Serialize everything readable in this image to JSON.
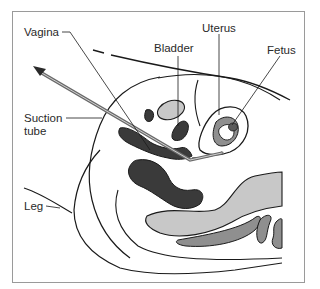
{
  "diagram": {
    "type": "anatomical-illustration",
    "labels": {
      "vagina": "Vagina",
      "bladder": "Bladder",
      "uterus": "Uterus",
      "fetus": "Fetus",
      "suction_tube_line1": "Suction",
      "suction_tube_line2": "tube",
      "leg": "Leg"
    },
    "colors": {
      "outline": "#1a1a1a",
      "dark_tissue": "#3a3a3a",
      "mid_gray": "#8f8f8f",
      "light_gray": "#c8c8c8",
      "tube": "#6a6a6a",
      "frame": "#9a9a9a"
    }
  }
}
